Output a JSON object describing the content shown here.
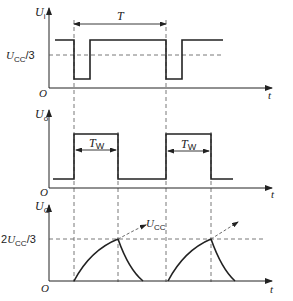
{
  "diagram": {
    "panels": [
      {
        "id": "input",
        "ylabel": {
          "main": "U",
          "sub": "i"
        },
        "threshold_label": {
          "main": "U",
          "sub": "CC",
          "suffix": "/3"
        },
        "origin": "O",
        "xlabel": "t",
        "period_label": "T"
      },
      {
        "id": "output",
        "ylabel": {
          "main": "U",
          "sub": "o"
        },
        "origin": "O",
        "xlabel": "t",
        "pulse_width_labels": [
          {
            "main": "T",
            "sub": "W"
          },
          {
            "main": "T",
            "sub": "W"
          }
        ]
      },
      {
        "id": "capacitor",
        "ylabel": {
          "main": "U",
          "sub": "C"
        },
        "threshold_label": {
          "prefix": "2",
          "main": "U",
          "sub": "CC",
          "suffix": "/3"
        },
        "asymptote_label": {
          "main": "U",
          "sub": "CC"
        },
        "origin": "O",
        "xlabel": "t"
      }
    ],
    "colors": {
      "line": "#222222",
      "dashed": "#444444",
      "background": "#ffffff"
    }
  }
}
